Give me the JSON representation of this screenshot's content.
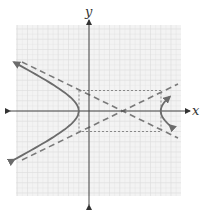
{
  "figure": {
    "type": "hyperbola-graph",
    "axes": {
      "x_label": "x",
      "y_label": "y"
    },
    "equation_implied": "(x-3)^2/16 - y^2/4 = 1",
    "center": [
      3,
      0
    ],
    "a": 4,
    "b": 2,
    "vertices": [
      [
        -1,
        0
      ],
      [
        7,
        0
      ]
    ],
    "asymptotes": [
      "y = (1/2)(x-3)",
      "y = -(1/2)(x-3)"
    ],
    "fundamental_rectangle": {
      "x_min": -1,
      "x_max": 7,
      "y_min": -2,
      "y_max": 2
    },
    "grid": {
      "x_range": [
        -7,
        9
      ],
      "y_range": [
        -8,
        8
      ],
      "unit": 1
    },
    "colors": {
      "grid": "#d9d9d9",
      "grid_bg": "#f2f2f2",
      "axis": "#444444",
      "curve": "#6b6b6b",
      "asymptote": "#7a7a7a",
      "rectangle": "#8a8a8a"
    }
  }
}
